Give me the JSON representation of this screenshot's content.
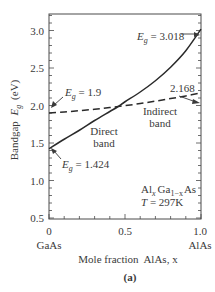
{
  "chart_data": {
    "type": "line",
    "title": "",
    "panel_label": "(a)",
    "xlabel": "Mole fraction  AlAs, x",
    "ylabel": "Bandgap E_g (eV)",
    "ylabel_prefix": "Bandgap",
    "ylabel_symbol": "E",
    "ylabel_sub": "g",
    "ylabel_unit": "(eV)",
    "xlim": [
      0,
      1.0
    ],
    "ylim": [
      0.5,
      3.2
    ],
    "x_ticks": [
      0,
      0.5,
      1.0
    ],
    "x_tick_labels": [
      "0",
      "0.5",
      "1.0"
    ],
    "x_end_labels": [
      "GaAs",
      "AlAs"
    ],
    "y_ticks": [
      0.5,
      1.0,
      1.5,
      2.0,
      2.5,
      3.0
    ],
    "y_tick_labels": [
      "0.5",
      "1.0",
      "1.5",
      "2.0",
      "2.5",
      "3.0"
    ],
    "grid": false,
    "series": [
      {
        "name": "Direct band",
        "style": "solid",
        "x": [
          0,
          0.1,
          0.2,
          0.3,
          0.4,
          0.45,
          0.5,
          0.6,
          0.7,
          0.8,
          0.9,
          1.0
        ],
        "values": [
          1.424,
          1.55,
          1.67,
          1.8,
          1.92,
          1.98,
          2.05,
          2.18,
          2.33,
          2.51,
          2.73,
          3.018
        ]
      },
      {
        "name": "Indirect band",
        "style": "dashed",
        "x": [
          0,
          0.1,
          0.2,
          0.3,
          0.4,
          0.5,
          0.6,
          0.7,
          0.8,
          0.9,
          1.0
        ],
        "values": [
          1.9,
          1.914,
          1.931,
          1.95,
          1.973,
          1.998,
          2.026,
          2.058,
          2.092,
          2.128,
          2.168
        ]
      }
    ],
    "annotations": [
      {
        "text": "E_g = 3.018",
        "sym": "E",
        "sub": "g",
        "rest": " = 3.018",
        "x": 1.0,
        "y": 3.018
      },
      {
        "text": "2.168",
        "x": 1.0,
        "y": 2.168
      },
      {
        "text": "E_g = 1.9",
        "sym": "E",
        "sub": "g",
        "rest": " = 1.9",
        "x": 0,
        "y": 1.9
      },
      {
        "text": "E_g = 1.424",
        "sym": "E",
        "sub": "g",
        "rest": " = 1.424",
        "x": 0,
        "y": 1.424
      },
      {
        "text": "Direct",
        "line2": "band"
      },
      {
        "text": "Indirect",
        "line2": "band"
      }
    ],
    "material": {
      "al": "Al",
      "al_sub": "x",
      "ga": "Ga",
      "ga_sub": "1−x",
      "as": "As"
    },
    "temperature": "T = 297K",
    "temperature_sym": "T",
    "temperature_rest": " = 297K"
  }
}
